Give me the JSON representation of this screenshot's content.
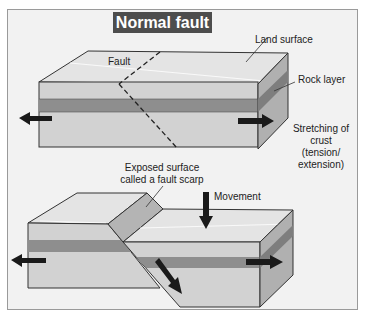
{
  "title": "Normal fault",
  "labels": {
    "land_surface": "Land surface",
    "fault": "Fault",
    "rock_layer": "Rock layer",
    "stretching_line1": "Stretching of",
    "stretching_line2": "crust",
    "stretching_line3": "(tension/",
    "stretching_line4": "extension)",
    "scarp_line1": "Exposed surface",
    "scarp_line2": "called a fault scarp",
    "movement": "Movement"
  },
  "colors": {
    "background": "#f2f2f2",
    "title_bg": "#4d4d4d",
    "top_face": "#e2e2e2",
    "front_face": "#d0d0d0",
    "rock_layer": "#8c8c8c",
    "side_face": "#a8a8a8",
    "arrow": "#1a1a1a"
  }
}
